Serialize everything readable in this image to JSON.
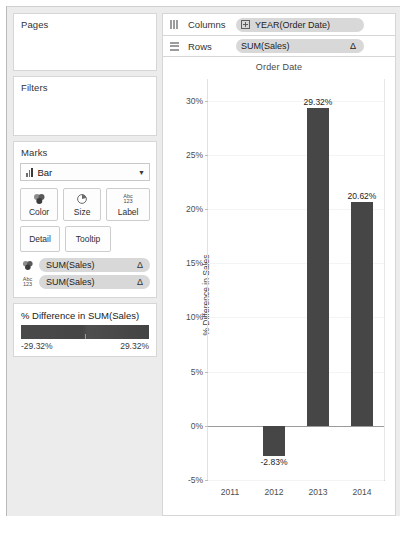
{
  "left_panel": {
    "pages": {
      "title": "Pages"
    },
    "filters": {
      "title": "Filters"
    },
    "marks": {
      "title": "Marks",
      "type_value": "Bar",
      "type_icon": "bar-mark-icon",
      "caret_icon": "chevron-down-icon",
      "buttons": [
        {
          "label": "Color",
          "icon": "color-palette-icon"
        },
        {
          "label": "Size",
          "icon": "size-pie-icon"
        },
        {
          "label": "Label",
          "icon": "abc123-label-icon"
        },
        {
          "label": "Detail",
          "icon": "detail-icon"
        },
        {
          "label": "Tooltip",
          "icon": "tooltip-icon"
        }
      ],
      "abc_top": "Abc",
      "abc_bottom": "123",
      "pills": [
        {
          "icon": "color-palette-icon",
          "label": "SUM(Sales)",
          "badge": "Δ"
        },
        {
          "icon": "abc123-label-icon",
          "label": "SUM(Sales)",
          "badge": "Δ"
        }
      ]
    },
    "legend": {
      "title": "% Difference in SUM(Sales)",
      "min_label": "-29.32%",
      "max_label": "29.32%",
      "color_start": "#4a4a4a",
      "color_end": "#434343"
    }
  },
  "shelves": {
    "columns": {
      "label": "Columns",
      "icon": "columns-shelf-icon",
      "pill": "YEAR(Order Date)",
      "pill_icon": "expand-plus-icon"
    },
    "rows": {
      "label": "Rows",
      "icon": "rows-shelf-icon",
      "pill": "SUM(Sales)",
      "badge": "Δ"
    }
  },
  "chart_data": {
    "type": "bar",
    "title": "Order Date",
    "xlabel": "",
    "ylabel": "% Difference in Sales",
    "categories": [
      "2011",
      "2012",
      "2013",
      "2014"
    ],
    "values": [
      null,
      -2.83,
      29.32,
      20.62
    ],
    "data_labels": [
      "",
      "-2.83%",
      "29.32%",
      "20.62%"
    ],
    "yticks": [
      30,
      25,
      20,
      15,
      10,
      5,
      0,
      -5
    ],
    "ytick_labels": [
      "30%",
      "25%",
      "20%",
      "15%",
      "10%",
      "5%",
      "0%",
      "-5%"
    ],
    "ylim": [
      -5,
      32
    ],
    "grid": true,
    "legend": "none",
    "bar_color": "#464646"
  }
}
